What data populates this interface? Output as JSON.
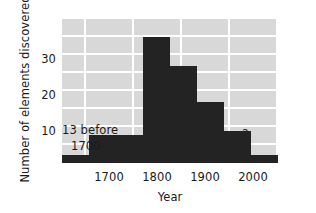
{
  "chart_data": {
    "type": "bar",
    "title": "",
    "subtitle": "",
    "xlabel": "Year",
    "ylabel": "Number of elements discovered",
    "xlim": [
      1650,
      2050
    ],
    "ylim": [
      0,
      36
    ],
    "xticks": [
      1700,
      1800,
      1900,
      2000
    ],
    "xtick_labels": [
      "1700",
      "1800",
      "1900",
      "2000"
    ],
    "yticks": [
      10,
      20,
      30
    ],
    "ytick_labels": [
      "10",
      "20",
      "30"
    ],
    "grid": true,
    "legend": "none",
    "bin_width": 50,
    "categories": [
      "1650-1700",
      "1700-1750",
      "1750-1800",
      "1800-1850",
      "1850-1900",
      "1900-1950",
      "1950-2000",
      "2000-2050"
    ],
    "bin_starts": [
      1650,
      1700,
      1750,
      1800,
      1850,
      1900,
      1950,
      2000
    ],
    "values": [
      2,
      7,
      7,
      31,
      24,
      15,
      8,
      2
    ],
    "annotations": [
      {
        "name": "before-1700-note",
        "line1": "13 before",
        "line2": "1700"
      },
      {
        "name": "unknown-future-marker",
        "text": "?"
      }
    ]
  },
  "axes": {
    "ylabel": "Number of elements discovered",
    "xlabel": "Year",
    "yticks": [
      {
        "label": "30",
        "value": 30
      },
      {
        "label": "20",
        "value": 20
      },
      {
        "label": "10",
        "value": 10
      }
    ],
    "xticks": [
      {
        "label": "1700",
        "value": 1700
      },
      {
        "label": "1800",
        "value": 1800
      },
      {
        "label": "1900",
        "value": 1900
      },
      {
        "label": "2000",
        "value": 2000
      }
    ]
  },
  "annotations": {
    "before_line1": "13 before",
    "before_line2": "1700",
    "question_mark": "?"
  },
  "colors": {
    "plot_background": "#d8d8d8",
    "gridline": "#ffffff",
    "bar_fill": "#232323",
    "page_background": "#ffffff",
    "text": "#1a1a1a"
  }
}
